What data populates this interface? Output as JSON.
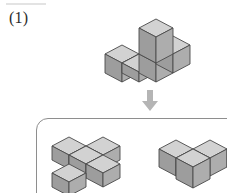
{
  "page": {
    "width": 227,
    "height": 193,
    "background": "#ffffff",
    "scan_artifact": true
  },
  "question": {
    "number_label": "(1)",
    "type": "cube-net-unfolding-multiple-choice"
  },
  "colors": {
    "cube_top_face": "#d2d2d2",
    "cube_left_face": "#9d9d9d",
    "cube_right_face": "#adadad",
    "cube_edge": "#4a4a4a",
    "panel_border": "#8e8e8e",
    "arrow": "#b5b5b5",
    "label_text": "#2b2b2b"
  },
  "prompt_figure": {
    "name": "prompt-solid",
    "description": "isometric solid: row of three unit cubes with one cube stacked on the middle cube",
    "cube_count": 4,
    "cells": [
      {
        "x": 0,
        "y": 0,
        "z": 0
      },
      {
        "x": 1,
        "y": 0,
        "z": 0
      },
      {
        "x": 2,
        "y": 0,
        "z": 0
      },
      {
        "x": 1,
        "y": 0,
        "z": 1
      }
    ]
  },
  "arrow": {
    "name": "down-arrow",
    "direction": "down",
    "glyph": "arrow-down-icon"
  },
  "options_panel": {
    "name": "answer-options-panel",
    "shape": "rounded-rectangle",
    "clipped_at_right_edge": true,
    "options": [
      {
        "name": "option-a",
        "description": "flat chevron / V-shaped arrangement of four cubes lying on one layer",
        "cube_count": 4,
        "cells": [
          {
            "x": 0,
            "y": 1,
            "z": 0
          },
          {
            "x": 1,
            "y": 1,
            "z": 0
          },
          {
            "x": 1,
            "y": 0,
            "z": 0
          },
          {
            "x": 2,
            "y": 0,
            "z": 0
          }
        ]
      },
      {
        "name": "option-b",
        "description": "row of cubes with one cube stepped forward, partially cut off by the image edge",
        "cube_count": 4,
        "clipped": true,
        "cells": [
          {
            "x": 0,
            "y": 0,
            "z": 0
          },
          {
            "x": 1,
            "y": 0,
            "z": 0
          },
          {
            "x": 2,
            "y": 0,
            "z": 0
          },
          {
            "x": 1,
            "y": 1,
            "z": 0
          }
        ]
      }
    ]
  }
}
